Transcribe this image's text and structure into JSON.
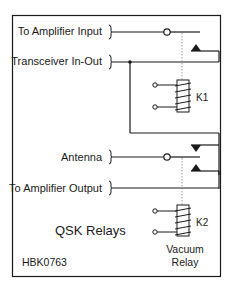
{
  "diagram": {
    "title": "QSK Relays",
    "figure_id": "HBK0763",
    "ports": {
      "amp_input": "To Amplifier Input",
      "transceiver": "Transceiver In-Out",
      "antenna": "Antenna",
      "amp_output": "To Amplifier Output"
    },
    "relays": {
      "k1": {
        "label": "K1"
      },
      "k2": {
        "label": "K2",
        "note_line1": "Vacuum",
        "note_line2": "Relay"
      }
    },
    "colors": {
      "line": "#1a1a1a",
      "background": "#ffffff",
      "link": "#888888"
    }
  }
}
